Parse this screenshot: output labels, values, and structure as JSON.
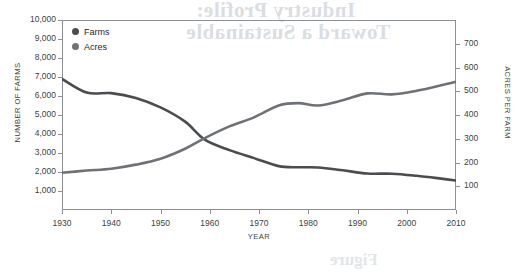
{
  "chart_data": {
    "type": "line",
    "title": "",
    "xlabel": "YEAR",
    "ylabel": "NUMBER OF FARMS",
    "y2label": "ACRES PER FARM",
    "xlim": [
      1930,
      2010
    ],
    "ylim": [
      0,
      10000
    ],
    "y2lim": [
      0,
      800
    ],
    "grid": false,
    "legend_position": "top-left-inside",
    "x_ticks": [
      "1930",
      "1940",
      "1950",
      "1960",
      "1970",
      "1980",
      "1990",
      "2000",
      "2010"
    ],
    "y_ticks": [
      "1,000",
      "2,000",
      "3,000",
      "4,000",
      "5,000",
      "6,000",
      "7,000",
      "8,000",
      "9,000",
      "10,000"
    ],
    "y2_ticks": [
      "100",
      "200",
      "300",
      "400",
      "500",
      "600",
      "700"
    ],
    "x": [
      1930,
      1935,
      1940,
      1945,
      1950,
      1955,
      1959,
      1964,
      1969,
      1974,
      1978,
      1982,
      1987,
      1992,
      1997,
      2002,
      2007,
      2010
    ],
    "series": [
      {
        "name": "Farms",
        "axis": "left",
        "color": "#4a4c50",
        "values": [
          6900,
          6180,
          6150,
          5900,
          5400,
          4650,
          3700,
          3150,
          2730,
          2310,
          2250,
          2240,
          2090,
          1920,
          1910,
          1800,
          1650,
          1550
        ]
      },
      {
        "name": "Acres",
        "axis": "right",
        "color": "#6e7276",
        "values": [
          157,
          166,
          174,
          191,
          216,
          258,
          303,
          352,
          390,
          440,
          450,
          440,
          462,
          491,
          487,
          502,
          525,
          540
        ]
      }
    ],
    "legend": [
      {
        "label": "Farms",
        "color": "#4a4c50"
      },
      {
        "label": "Acres",
        "color": "#6e7276"
      }
    ],
    "annotations": []
  },
  "bleed_through": {
    "line1": "Industry Profile:",
    "line2": "Toward a Sustainable",
    "line3": "Figure"
  }
}
